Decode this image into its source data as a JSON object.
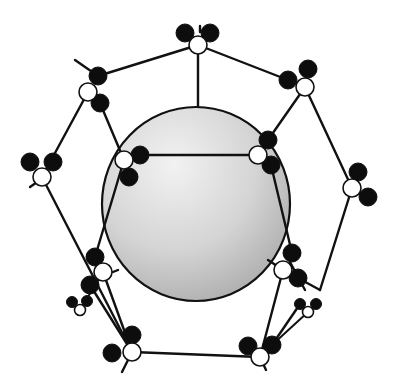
{
  "diagram": {
    "width": 400,
    "height": 384,
    "colors": {
      "background": "#ffffff",
      "stroke": "#111111",
      "black_atom": "#0d0d0d",
      "white_atom": "#ffffff",
      "sphere_light": "#f2f2f2",
      "sphere_mid": "#d4d4d4",
      "sphere_dark": "#a8a8a8"
    },
    "sphere": {
      "cx": 196,
      "cy": 204,
      "rx": 94,
      "ry": 97
    },
    "bonds": [
      [
        198,
        45,
        98,
        76
      ],
      [
        198,
        45,
        288,
        80
      ],
      [
        198,
        45,
        198,
        106
      ],
      [
        88,
        92,
        42,
        177
      ],
      [
        100,
        103,
        124,
        160
      ],
      [
        305,
        87,
        352,
        188
      ],
      [
        305,
        87,
        268,
        140
      ],
      [
        140,
        155,
        258,
        155
      ],
      [
        42,
        177,
        132,
        352
      ],
      [
        124,
        160,
        95,
        257
      ],
      [
        271,
        165,
        292,
        253
      ],
      [
        103,
        272,
        132,
        352
      ],
      [
        90,
        285,
        132,
        352
      ],
      [
        352,
        188,
        320,
        290
      ],
      [
        320,
        290,
        298,
        278
      ],
      [
        283,
        270,
        260,
        357
      ],
      [
        300,
        304,
        272,
        345
      ],
      [
        132,
        352,
        260,
        357
      ],
      [
        75,
        60,
        98,
        76
      ],
      [
        30,
        187,
        40,
        180
      ],
      [
        113,
        272,
        118,
        270
      ],
      [
        268,
        260,
        300,
        281
      ],
      [
        290,
        262,
        305,
        290
      ],
      [
        132,
        352,
        122,
        372
      ],
      [
        260,
        357,
        266,
        370
      ],
      [
        200,
        26,
        200,
        32
      ]
    ],
    "atoms": [
      {
        "group": "top",
        "white": [
          198,
          45
        ],
        "black": [
          [
            185,
            33
          ],
          [
            210,
            33
          ]
        ],
        "r": 9
      },
      {
        "group": "upper-left",
        "white": [
          88,
          92
        ],
        "black": [
          [
            98,
            76
          ],
          [
            100,
            103
          ]
        ],
        "r": 9
      },
      {
        "group": "upper-right",
        "white": [
          305,
          87
        ],
        "black": [
          [
            288,
            80
          ],
          [
            308,
            69
          ]
        ],
        "r": 9
      },
      {
        "group": "far-left",
        "white": [
          42,
          177
        ],
        "black": [
          [
            30,
            162
          ],
          [
            53,
            162
          ]
        ],
        "r": 9
      },
      {
        "group": "far-right",
        "white": [
          352,
          188
        ],
        "black": [
          [
            358,
            172
          ],
          [
            368,
            197
          ]
        ],
        "r": 9
      },
      {
        "group": "inner-left",
        "white": [
          124,
          160
        ],
        "black": [
          [
            140,
            155
          ],
          [
            129,
            177
          ]
        ],
        "r": 9
      },
      {
        "group": "inner-right",
        "white": [
          258,
          155
        ],
        "black": [
          [
            268,
            140
          ],
          [
            271,
            165
          ]
        ],
        "r": 9
      },
      {
        "group": "lower-left-mid",
        "white": [
          103,
          272
        ],
        "black": [
          [
            95,
            257
          ],
          [
            90,
            285
          ]
        ],
        "r": 9
      },
      {
        "group": "lower-right-mid",
        "white": [
          283,
          270
        ],
        "black": [
          [
            292,
            253
          ],
          [
            298,
            278
          ]
        ],
        "r": 9
      },
      {
        "group": "small-left",
        "white": [
          80,
          310
        ],
        "black": [
          [
            72,
            302
          ],
          [
            87,
            301
          ]
        ],
        "r": 5.5
      },
      {
        "group": "small-right",
        "white": [
          308,
          312
        ],
        "black": [
          [
            300,
            304
          ],
          [
            316,
            304
          ]
        ],
        "r": 5.5
      },
      {
        "group": "bottom-left",
        "white": [
          132,
          352
        ],
        "black": [
          [
            112,
            353
          ],
          [
            132,
            335
          ]
        ],
        "r": 9
      },
      {
        "group": "bottom-right",
        "white": [
          260,
          357
        ],
        "black": [
          [
            248,
            346
          ],
          [
            272,
            345
          ]
        ],
        "r": 9
      }
    ],
    "small_bonds": [
      [
        80,
        310,
        103,
        272
      ],
      [
        308,
        312,
        272,
        345
      ]
    ]
  }
}
